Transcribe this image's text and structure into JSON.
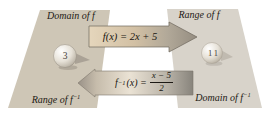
{
  "labels": {
    "domain_f": "Domain of f",
    "range_f": "Range of f",
    "range_f_inv": {
      "base": "Range of f",
      "sup": "−1"
    },
    "domain_f_inv": {
      "base": "Domain of f",
      "sup": "−1"
    }
  },
  "formulas": {
    "forward": "f(x) = 2x + 5",
    "inverse": {
      "f": "f",
      "sup": "−1",
      "mid": "(x) =",
      "num": "x − 5",
      "den": "2"
    }
  },
  "values": {
    "left": "3",
    "right": "11"
  },
  "colors": {
    "left_panel": "#cec6b6",
    "right_panel": "#d8d3ca",
    "arrow_light_tan": "#e5d6bc",
    "arrow_gray": "#958d81",
    "arrow_cream": "#eae2d4",
    "arrow_dark_end": "#88847c",
    "text": "#1c1914"
  }
}
